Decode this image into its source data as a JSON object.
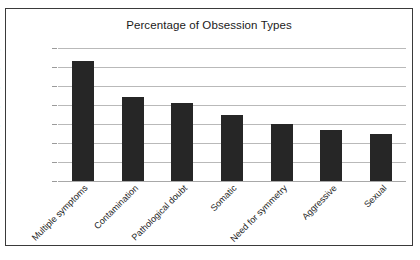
{
  "chart_data": {
    "type": "bar",
    "title": "Percentage of Obsession Types",
    "xlabel": "",
    "ylabel": "",
    "ylim": [
      0,
      70
    ],
    "ytick_labels": [
      "70%",
      "60%",
      "50%",
      "40%",
      "30%",
      "20%",
      "10%",
      "0%"
    ],
    "ytick_values": [
      70,
      60,
      50,
      40,
      30,
      20,
      10,
      0
    ],
    "grid": true,
    "legend": false,
    "bar_color": "#262626",
    "categories": [
      "Multiple symptoms",
      "Contamination",
      "Pathological doubt",
      "Somatic",
      "Need for symmetry",
      "Aggressive",
      "Sexual"
    ],
    "values": [
      63,
      44,
      41,
      35,
      30,
      27,
      25
    ]
  },
  "colors": {
    "frame": "#3a3a3a",
    "gridline": "#b9b9b9",
    "axis": "#a8a8a8",
    "bar": "#262626",
    "text": "#1a1a1a",
    "background": "#ffffff"
  }
}
